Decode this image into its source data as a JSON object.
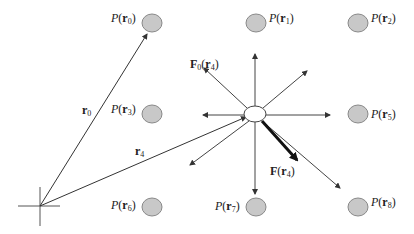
{
  "diagram": {
    "origin": {
      "x": 40,
      "y": 206
    },
    "center_particle": {
      "x": 255,
      "y": 114,
      "rx": 11,
      "ry": 8,
      "fill": "#ffffff"
    },
    "grid_point_fill": "#c8c8c8",
    "grid_points": [
      {
        "id": "P0",
        "label_func": "P",
        "label_var": "r",
        "label_sub": "0",
        "cx": 152,
        "cy": 23,
        "label_side": "left"
      },
      {
        "id": "P1",
        "label_func": "P",
        "label_var": "r",
        "label_sub": "1",
        "cx": 256,
        "cy": 23,
        "label_side": "right"
      },
      {
        "id": "P2",
        "label_func": "P",
        "label_var": "r",
        "label_sub": "2",
        "cx": 358,
        "cy": 23,
        "label_side": "right"
      },
      {
        "id": "P3",
        "label_func": "P",
        "label_var": "r",
        "label_sub": "3",
        "cx": 152,
        "cy": 114,
        "label_side": "left"
      },
      {
        "id": "P5",
        "label_func": "P",
        "label_var": "r",
        "label_sub": "5",
        "cx": 358,
        "cy": 114,
        "label_side": "right"
      },
      {
        "id": "P6",
        "label_func": "P",
        "label_var": "r",
        "label_sub": "6",
        "cx": 152,
        "cy": 207,
        "label_side": "left"
      },
      {
        "id": "P7",
        "label_func": "P",
        "label_var": "r",
        "label_sub": "7",
        "cx": 256,
        "cy": 207,
        "label_side": "left"
      },
      {
        "id": "P8",
        "label_func": "P",
        "label_var": "r",
        "label_sub": "8",
        "cx": 358,
        "cy": 207,
        "label_side": "right"
      }
    ],
    "position_vectors": [
      {
        "label_var": "r",
        "label_sub": "0",
        "from": [
          40,
          206
        ],
        "to": [
          147,
          34
        ],
        "label_pos": [
          84,
          112
        ]
      },
      {
        "label_var": "r",
        "label_sub": "4",
        "from": [
          40,
          206
        ],
        "to": [
          246,
          117
        ],
        "label_pos": [
          136,
          156
        ]
      }
    ],
    "force_vectors": [
      {
        "dir": "up",
        "to": [
          255,
          54
        ]
      },
      {
        "dir": "up-left",
        "to": [
          204,
          68
        ]
      },
      {
        "dir": "up-right",
        "to": [
          307,
          71
        ]
      },
      {
        "dir": "left",
        "to": [
          203,
          115
        ]
      },
      {
        "dir": "right",
        "to": [
          330,
          115
        ]
      },
      {
        "dir": "down-left",
        "to": [
          190,
          165
        ]
      },
      {
        "dir": "down",
        "to": [
          255,
          194
        ]
      },
      {
        "dir": "down-right",
        "to": [
          340,
          188
        ]
      }
    ],
    "labels": {
      "F0": {
        "func": "F",
        "func_sub": "0",
        "var": "r",
        "var_sub": "4",
        "x": 190,
        "y": 67
      },
      "F": {
        "func": "F",
        "var": "r",
        "var_sub": "4",
        "x": 268,
        "y": 175
      }
    },
    "resultant_force": {
      "from": [
        262,
        121
      ],
      "to": [
        297,
        160
      ],
      "stroke_width": 3
    },
    "text": {
      "p_func": "P",
      "paren_open": "(",
      "paren_close": ")",
      "r": "r",
      "F": "F",
      "s0": "0",
      "s1": "1",
      "s2": "2",
      "s3": "3",
      "s4": "4",
      "s5": "5",
      "s6": "6",
      "s7": "7",
      "s8": "8"
    }
  }
}
